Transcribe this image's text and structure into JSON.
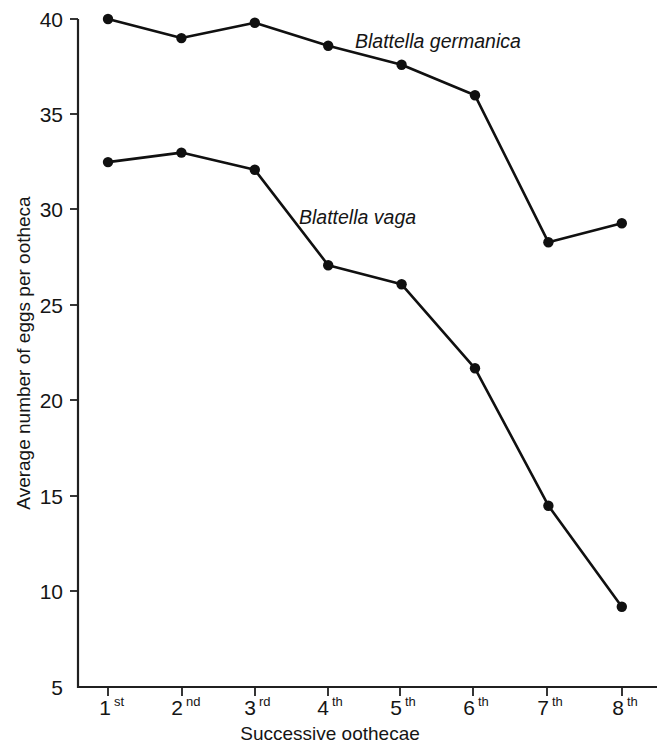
{
  "chart_data": {
    "type": "line",
    "title": "",
    "xlabel": "Successive oothecae",
    "ylabel": "Average number of eggs per ootheca",
    "categories": [
      "1st",
      "2nd",
      "3rd",
      "4th",
      "5th",
      "6th",
      "7th",
      "8th"
    ],
    "category_parts": [
      {
        "num": "1",
        "sup": "st"
      },
      {
        "num": "2",
        "sup": "nd"
      },
      {
        "num": "3",
        "sup": "rd"
      },
      {
        "num": "4",
        "sup": "th"
      },
      {
        "num": "5",
        "sup": "th"
      },
      {
        "num": "6",
        "sup": "th"
      },
      {
        "num": "7",
        "sup": "th"
      },
      {
        "num": "8",
        "sup": "th"
      }
    ],
    "ylim": [
      5,
      40
    ],
    "yticks": [
      40,
      35,
      30,
      25,
      20,
      15,
      10,
      5
    ],
    "ytick_labels": [
      "40",
      "35",
      "30",
      "25",
      "20",
      "15",
      "10",
      "5"
    ],
    "grid": false,
    "legend_position": "inline-annotations",
    "marker": "filled-circle",
    "line_color": "#101010",
    "series": [
      {
        "name": "Blattella germanica",
        "values": [
          40.0,
          39.0,
          39.8,
          38.6,
          37.6,
          36.0,
          28.3,
          29.3
        ],
        "label_x": "4th",
        "italic": true
      },
      {
        "name": "Blattella vaga",
        "values": [
          32.5,
          33.0,
          32.1,
          27.1,
          26.1,
          21.7,
          14.5,
          9.2
        ],
        "label_x": "3rd",
        "italic": true
      }
    ]
  },
  "annotations": [
    {
      "name": "germanica-label",
      "text": "Blattella germanica"
    },
    {
      "name": "vaga-label",
      "text": "Blattella vaga"
    }
  ]
}
